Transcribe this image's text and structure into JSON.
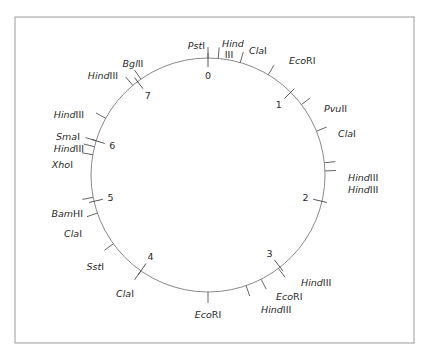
{
  "diagram": {
    "type": "circular-restriction-map",
    "center": [
      208,
      175
    ],
    "radius": 117,
    "frame": {
      "x": 15,
      "y": 17,
      "w": 399,
      "h": 326
    },
    "colors": {
      "ring": "#8a8a8a",
      "frame": "#9a9a9a",
      "text": "#2a2a2a",
      "background": "#ffffff"
    },
    "map_markers": [
      {
        "label": "0",
        "angle": 0
      },
      {
        "label": "1",
        "angle": 45
      },
      {
        "label": "2",
        "angle": 103
      },
      {
        "label": "3",
        "angle": 142
      },
      {
        "label": "4",
        "angle": 215
      },
      {
        "label": "5",
        "angle": 257
      },
      {
        "label": "6",
        "angle": 287
      },
      {
        "label": "7",
        "angle": 323
      }
    ],
    "sites": [
      {
        "enzyme": "PstI",
        "italic": "Pst",
        "roman": "I",
        "angle": 0,
        "lx": 205,
        "ly": 49,
        "anchor": "end"
      },
      {
        "enzyme": "HindIII",
        "italic": "Hind",
        "roman": "",
        "angle": 5,
        "lx": 222,
        "ly": 47,
        "anchor": "start",
        "second_line": "III",
        "l2x": 229,
        "l2y": 58
      },
      {
        "enzyme": "ClaI",
        "italic": "Cla",
        "roman": "I",
        "angle": 16,
        "lx": 249,
        "ly": 54,
        "anchor": "start"
      },
      {
        "enzyme": "EcoRI",
        "italic": "Eco",
        "roman": "RI",
        "angle": 31,
        "lx": 289,
        "ly": 64,
        "anchor": "start"
      },
      {
        "enzyme": "PvuII",
        "italic": "Pvu",
        "roman": "II",
        "angle": 53,
        "lx": 324,
        "ly": 112,
        "anchor": "start"
      },
      {
        "enzyme": "ClaI",
        "italic": "Cla",
        "roman": "I",
        "angle": 68,
        "lx": 338,
        "ly": 137,
        "anchor": "start"
      },
      {
        "enzyme": "HindIII",
        "italic": "Hind",
        "roman": "III",
        "angle": 84,
        "lx": 348,
        "ly": 181,
        "anchor": "start"
      },
      {
        "enzyme": "HindIII",
        "italic": "Hind",
        "roman": "III",
        "angle": 88,
        "lx": 348,
        "ly": 193,
        "anchor": "start"
      },
      {
        "enzyme": "HindIII",
        "italic": "Hind",
        "roman": "III",
        "angle": 143,
        "lx": 301,
        "ly": 286,
        "anchor": "start"
      },
      {
        "enzyme": "EcoRI",
        "italic": "Eco",
        "roman": "RI",
        "angle": 153,
        "lx": 276,
        "ly": 300,
        "anchor": "start"
      },
      {
        "enzyme": "HindIII",
        "italic": "Hind",
        "roman": "III",
        "angle": 161,
        "lx": 261,
        "ly": 313,
        "anchor": "start"
      },
      {
        "enzyme": "EcoRI",
        "italic": "Eco",
        "roman": "RI",
        "angle": 180,
        "lx": 208,
        "ly": 318,
        "anchor": "middle"
      },
      {
        "enzyme": "ClaI",
        "italic": "Cla",
        "roman": "I",
        "angle": 215,
        "lx": 134,
        "ly": 297,
        "anchor": "end"
      },
      {
        "enzyme": "SstI",
        "italic": "Sst",
        "roman": "I",
        "angle": 234,
        "lx": 104,
        "ly": 270,
        "anchor": "end"
      },
      {
        "enzyme": "ClaI",
        "italic": "Cla",
        "roman": "I",
        "angle": 251,
        "lx": 82,
        "ly": 237,
        "anchor": "end"
      },
      {
        "enzyme": "BamHI",
        "italic": "Bam",
        "roman": "HI",
        "angle": 259,
        "lx": 83,
        "ly": 217,
        "anchor": "end"
      },
      {
        "enzyme": "XhoI",
        "italic": "Xho",
        "roman": "I",
        "angle": 280,
        "lx": 73,
        "ly": 168,
        "anchor": "end"
      },
      {
        "enzyme": "HindIII",
        "italic": "Hind",
        "roman": "III",
        "angle": 284,
        "lx": 84,
        "ly": 152,
        "anchor": "end"
      },
      {
        "enzyme": "SmaI",
        "italic": "Sma",
        "roman": "I",
        "angle": 287,
        "lx": 80,
        "ly": 140,
        "anchor": "end"
      },
      {
        "enzyme": "HindIII",
        "italic": "Hind",
        "roman": "III",
        "angle": 299,
        "lx": 84,
        "ly": 118,
        "anchor": "end"
      },
      {
        "enzyme": "HindIII",
        "italic": "Hind",
        "roman": "III",
        "angle": 320,
        "lx": 118,
        "ly": 79,
        "anchor": "end"
      },
      {
        "enzyme": "BglII",
        "italic": "Bgl",
        "roman": "II",
        "angle": 325,
        "lx": 133,
        "ly": 67,
        "anchor": "middle"
      }
    ]
  }
}
